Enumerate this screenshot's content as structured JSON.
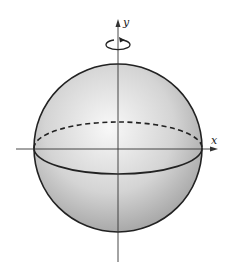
{
  "diagram": {
    "title": "",
    "axes": {
      "x_label": "x",
      "y_label": "y"
    },
    "shape": "sphere",
    "rotation_indicator": "rotation about y-axis",
    "equator": {
      "front": "solid",
      "back": "dashed"
    },
    "colors": {
      "sphere_light": "#f4f4f4",
      "sphere_dark": "#9a9a9a",
      "outline": "#222222",
      "axis": "#333333"
    }
  }
}
